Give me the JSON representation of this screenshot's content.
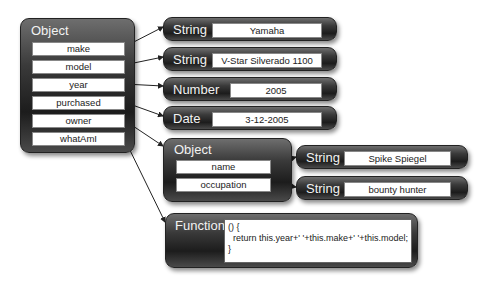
{
  "root": {
    "type": "Object",
    "fields": [
      "make",
      "model",
      "year",
      "purchased",
      "owner",
      "whatAmI"
    ]
  },
  "values": [
    {
      "type": "String",
      "value": "Yamaha"
    },
    {
      "type": "String",
      "value": "V-Star Silverado 1100"
    },
    {
      "type": "Number",
      "value": "2005"
    },
    {
      "type": "Date",
      "value": "3-12-2005"
    }
  ],
  "owner": {
    "type": "Object",
    "fields": [
      "name",
      "occupation"
    ],
    "values": [
      {
        "type": "String",
        "value": "Spike Spiegel"
      },
      {
        "type": "String",
        "value": "bounty hunter"
      }
    ]
  },
  "function": {
    "type": "Function",
    "code": "() {\n  return this.year+' '+this.make+' '+this.model;\n}"
  }
}
